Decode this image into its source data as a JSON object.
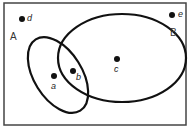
{
  "diagram": {
    "type": "venn",
    "universe": {
      "x": 4,
      "y": 3,
      "w": 182,
      "h": 122
    },
    "sets": [
      {
        "id": "A",
        "label": "A",
        "label_pos": {
          "x": 10,
          "y": 36
        },
        "cx": 58,
        "cy": 75,
        "rx": 24,
        "ry": 42,
        "rotate": -32
      },
      {
        "id": "B",
        "label": "B",
        "label_pos": {
          "x": 170,
          "y": 32
        },
        "cx": 122,
        "cy": 58,
        "rx": 64,
        "ry": 44,
        "rotate": 0
      }
    ],
    "points": [
      {
        "id": "d",
        "label": "d",
        "x": 22,
        "y": 19,
        "region": "outside"
      },
      {
        "id": "e",
        "label": "e",
        "x": 172,
        "y": 15,
        "region": "outside"
      },
      {
        "id": "a",
        "label": "a",
        "x": 54,
        "y": 76,
        "region": "A only"
      },
      {
        "id": "b",
        "label": "b",
        "x": 73,
        "y": 71,
        "region": "A and B"
      },
      {
        "id": "c",
        "label": "c",
        "x": 117,
        "y": 59,
        "region": "B only"
      }
    ],
    "colors": {
      "stroke": "#111111",
      "frame": "#444444",
      "background": "#ffffff"
    }
  }
}
